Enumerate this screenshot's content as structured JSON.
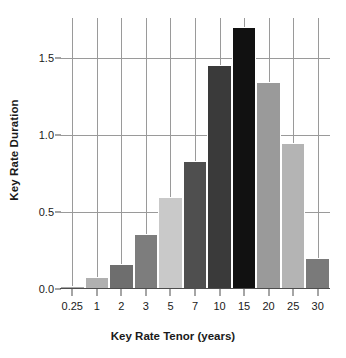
{
  "chart_data": {
    "type": "bar",
    "title": "",
    "xlabel": "Key Rate Tenor (years)",
    "ylabel": "Key Rate Duration",
    "categories": [
      "0.25",
      "1",
      "2",
      "3",
      "5",
      "7",
      "10",
      "15",
      "20",
      "25",
      "30"
    ],
    "values": [
      0.02,
      0.08,
      0.16,
      0.36,
      0.6,
      0.83,
      1.45,
      1.7,
      1.34,
      0.95,
      0.2
    ],
    "bar_colors": [
      "#a8a8a8",
      "#b0b0b0",
      "#6e6e6e",
      "#7d7d7d",
      "#c9c9c9",
      "#4f4f4f",
      "#3a3a3a",
      "#111111",
      "#9a9a9a",
      "#b4b4b4",
      "#7a7a7a"
    ],
    "ylim": [
      0.0,
      1.758
    ],
    "xlim_categories": 11,
    "yticks": [
      0.0,
      0.5,
      1.0,
      1.5
    ],
    "ytick_labels": [
      "0.0",
      "0.5",
      "1.0",
      "1.5"
    ],
    "grid": true,
    "grid_axes": "both",
    "grid_color": "#9a9a9a",
    "legend": "none",
    "background_color": "#ffffff",
    "axis_color": "#4d4d4d",
    "text_color": "#1a1a1a"
  }
}
